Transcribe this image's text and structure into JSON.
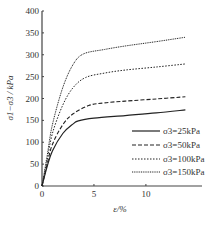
{
  "chart_data": {
    "type": "line",
    "title": "",
    "xlabel": "ε/%",
    "ylabel": "σ1−σ3 / kPa",
    "xlim": [
      0,
      15.4
    ],
    "ylim": [
      0,
      400
    ],
    "xticks": [
      0,
      5,
      10
    ],
    "yticks": [
      0,
      50,
      100,
      150,
      200,
      250,
      300,
      350,
      400
    ],
    "grid": false,
    "legend_position": "lower right",
    "series": [
      {
        "name": "σ3=25kPa",
        "style": "solid",
        "x": [
          0,
          0.5,
          1,
          2,
          3,
          3.5,
          5,
          8,
          11,
          13.8
        ],
        "y": [
          0,
          45,
          80,
          120,
          142,
          149,
          155,
          161,
          167,
          174
        ]
      },
      {
        "name": "σ3=50kPa",
        "style": "dashed",
        "x": [
          0,
          0.5,
          1,
          2,
          3,
          4.5,
          6,
          8,
          11,
          13.8
        ],
        "y": [
          0,
          50,
          95,
          140,
          165,
          184,
          190,
          194,
          199,
          204
        ]
      },
      {
        "name": "σ3=100kPa",
        "style": "dotted",
        "x": [
          0,
          0.5,
          1,
          2,
          3,
          4.2,
          6,
          8,
          11,
          13.8
        ],
        "y": [
          0,
          60,
          120,
          185,
          225,
          248,
          258,
          265,
          272,
          279
        ]
      },
      {
        "name": "σ3=150kPa",
        "style": "dotted-fine",
        "x": [
          0,
          0.5,
          1,
          2,
          3,
          4,
          6,
          8,
          11,
          13.8
        ],
        "y": [
          0,
          70,
          140,
          225,
          278,
          302,
          312,
          320,
          330,
          340
        ]
      }
    ]
  },
  "axes": {
    "xlabel": "ε/%",
    "ylabel": "σ1−σ3 / kPa",
    "xtick_labels": [
      "0",
      "5",
      "10"
    ],
    "ytick_labels": [
      "0",
      "50",
      "100",
      "150",
      "200",
      "250",
      "300",
      "350",
      "400"
    ]
  },
  "legend": [
    "σ3=25kPa",
    "σ3=50kPa",
    "σ3=100kPa",
    "σ3=150kPa"
  ]
}
